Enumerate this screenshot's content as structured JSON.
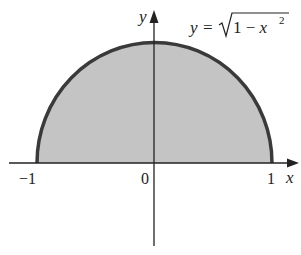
{
  "diagram": {
    "type": "semicircle-region",
    "equation": {
      "lhs": "y",
      "eq": "=",
      "radicand": "1 − x",
      "exponent": "2"
    },
    "axes": {
      "x_label": "x",
      "y_label": "y"
    },
    "ticks": {
      "neg_one": "−1",
      "zero": "0",
      "one": "1"
    },
    "colors": {
      "fill": "#c4c4c4",
      "curve": "#3a3a3a",
      "axis": "#222222"
    }
  }
}
